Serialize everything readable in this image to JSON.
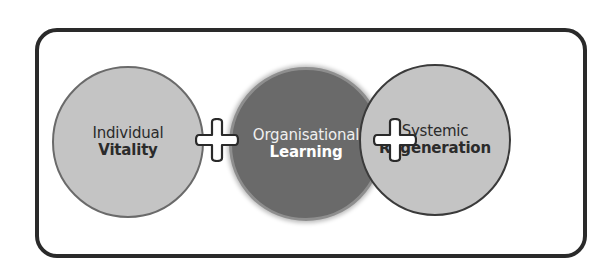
{
  "diagram": {
    "title": "",
    "frame": {
      "border_color": "#2a2a2a",
      "background": "#ffffff"
    },
    "nodes": [
      {
        "id": "individual-vitality",
        "line1": "Individual",
        "line2": "Vitality",
        "fill": "#c4c4c4",
        "text_color": "#2b2b2b"
      },
      {
        "id": "organisational-learning",
        "line1": "Organisational",
        "line2": "Learning",
        "fill": "#6a6a6a",
        "text_color": "#ffffff"
      },
      {
        "id": "systemic-regeneration",
        "line1": "Systemic",
        "line2": "Regeneration",
        "fill": "#c4c4c4",
        "text_color": "#2b2b2b"
      }
    ],
    "connectors": [
      {
        "symbol": "plus",
        "from": "individual-vitality",
        "to": "organisational-learning"
      },
      {
        "symbol": "plus",
        "from": "organisational-learning",
        "to": "systemic-regeneration"
      }
    ]
  }
}
